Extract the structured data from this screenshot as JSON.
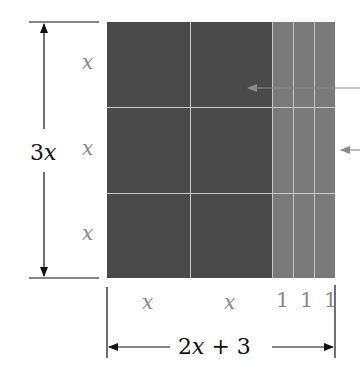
{
  "diagram": {
    "type": "area-model-rectangle",
    "height_label": {
      "coef": "3",
      "var": "x"
    },
    "width_label": {
      "text": "2x + 3",
      "parts": [
        "2",
        "x",
        "+",
        "3"
      ]
    },
    "row_labels": [
      "x",
      "x",
      "x"
    ],
    "column_labels": [
      "x",
      "x"
    ],
    "unit_labels": "1 1 1",
    "colors": {
      "x_squared_tiles": "#4a4a4a",
      "unit_strips": "#7a7a7a",
      "grid_lines": "#c8c8c8",
      "dimension_lines": "#111111",
      "labels_gray": "#8a8a8a"
    },
    "pointer_arrows": 2
  }
}
